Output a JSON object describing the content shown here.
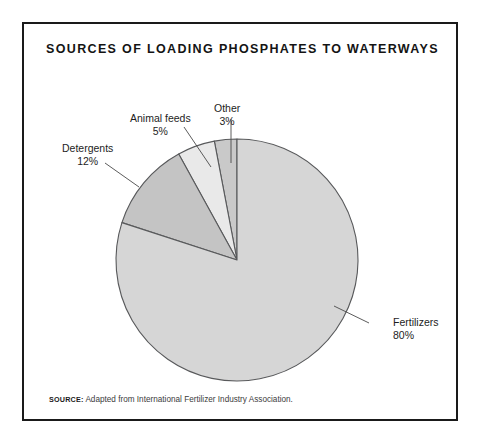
{
  "figure": {
    "title": "SOURCES OF LOADING PHOSPHATES TO WATERWAYS",
    "source_label": "SOURCE:",
    "source_text": "Adapted from International Fertilizer Industry Association."
  },
  "chart_data": {
    "type": "pie",
    "title": "SOURCES OF LOADING PHOSPHATES TO WATERWAYS",
    "xlabel": "",
    "ylabel": "",
    "unit": "%",
    "total": 100,
    "legend_position": "callout-labels",
    "grid": false,
    "start_angle_deg": 0,
    "direction": "counterclockwise",
    "categories": [
      "Other",
      "Animal feeds",
      "Detergents",
      "Fertilizers"
    ],
    "values": [
      3,
      5,
      12,
      80
    ],
    "slices": [
      {
        "name": "Other",
        "label": "Other",
        "value": 3,
        "value_label": "3%",
        "color": "#c9c9c9",
        "leader": "vertical"
      },
      {
        "name": "Animal feeds",
        "label": "Animal feeds",
        "value": 5,
        "value_label": "5%",
        "color": "#e9e9e9",
        "leader": "diagonal"
      },
      {
        "name": "Detergents",
        "label": "Detergents",
        "value": 12,
        "value_label": "12%",
        "color": "#c4c4c4",
        "leader": "diagonal"
      },
      {
        "name": "Fertilizers",
        "label": "Fertilizers",
        "value": 80,
        "value_label": "80%",
        "color": "#d6d6d6",
        "leader": "diagonal"
      }
    ],
    "colors": {
      "outline": "#58595b",
      "frame": "#1a1a1a",
      "background": "#ffffff",
      "text": "#1d1d1d"
    }
  },
  "callouts": {
    "detergents": {
      "label": "Detergents",
      "value_label": "12%"
    },
    "animal_feeds": {
      "label": "Animal feeds",
      "value_label": "5%"
    },
    "other": {
      "label": "Other",
      "value_label": "3%"
    },
    "fertilizers": {
      "label": "Fertilizers",
      "value_label": "80%"
    }
  }
}
